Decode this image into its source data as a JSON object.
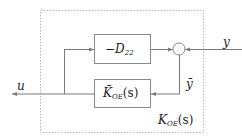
{
  "diagram": {
    "type": "block-diagram",
    "colors": {
      "line": "#7a7a7a",
      "dashed_border": "#b0b0b0",
      "text": "#222222",
      "background": "#ffffff"
    },
    "outer_box": {
      "label_main": "K",
      "label_sub": "OE",
      "label_arg": "(s)"
    },
    "blocks": [
      {
        "id": "d22",
        "label_prefix": "−",
        "label_main": "D",
        "label_sub": "22",
        "label_arg": ""
      },
      {
        "id": "kbar",
        "label_main": "K̄",
        "label_sub": "OE",
        "label_arg": "(s)"
      }
    ],
    "summing_junction": {
      "symbol": "circle"
    },
    "signals": {
      "input": "u",
      "output": "y",
      "internal": "ȳ"
    }
  }
}
